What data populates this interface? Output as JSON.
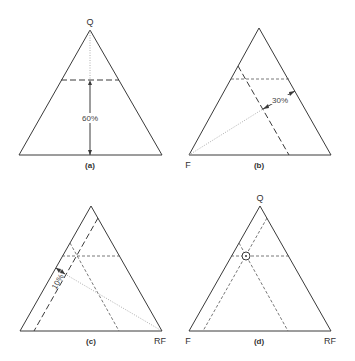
{
  "figure": {
    "panels": [
      {
        "id": "a",
        "caption": "(a)",
        "vertex_labels": {
          "top": "Q"
        },
        "annotation": "60%"
      },
      {
        "id": "b",
        "caption": "(b)",
        "vertex_labels": {
          "bottom_left": "F"
        },
        "annotation": "30%"
      },
      {
        "id": "c",
        "caption": "(c)",
        "vertex_labels": {
          "bottom_right": "RF"
        },
        "annotation": "10%"
      },
      {
        "id": "d",
        "caption": "(d)",
        "vertex_labels": {
          "top": "Q",
          "bottom_left": "F",
          "bottom_right": "RF"
        },
        "annotation": ""
      }
    ],
    "plotted_point": {
      "Q": 60,
      "F": 30,
      "RF": 10
    }
  }
}
